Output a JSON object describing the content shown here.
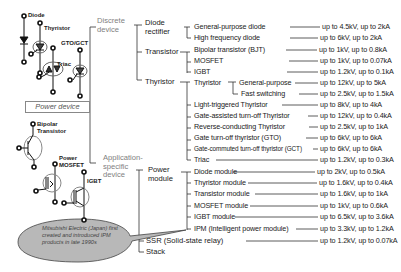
{
  "device_symbols": {
    "diode": "Diode",
    "thyristor": "Thyristor",
    "gto_gct": "GTO/GCT",
    "triac": "Triac",
    "bipolar_transistor": "Bipolar\nTransistor",
    "bipolar_line1": "Bipolar",
    "bipolar_line2": "Transistor",
    "power_mosfet_line1": "Power",
    "power_mosfet_line2": "MOSFET",
    "igbt": "IGBT"
  },
  "root": {
    "label": "Power device"
  },
  "branches": {
    "discrete": {
      "line1": "Discrete",
      "line2": "device"
    },
    "application_specific": {
      "line1": "Application-",
      "line2": "specific",
      "line3": "device"
    }
  },
  "categories": {
    "diode_rectifier": {
      "line1": "Diode",
      "line2": "rectifier"
    },
    "transistor": "Transistor",
    "thyristor": "Thyristor",
    "power_module": {
      "line1": "Power",
      "line2": "module"
    },
    "ssr": "SSR (Solid-state relay)",
    "stack": "Stack"
  },
  "items": [
    {
      "name": "General-purpose diode",
      "rating": "up to 4.5kV, up to 2kA"
    },
    {
      "name": "High frequency diode",
      "rating": "up to 6kV, up to 2kA"
    },
    {
      "name": "Bipolar transistor (BJT)",
      "rating": "up to 1kV, up to 0.8kA"
    },
    {
      "name": "MOSFET",
      "rating": "up to 1kV, up to 0.07kA"
    },
    {
      "name": "IGBT",
      "rating": "up to 1.2kV, up to 0.1kA"
    },
    {
      "name": "Thyristor",
      "sub": "General-purpose",
      "rating": "up to 12kV, up to 5kA"
    },
    {
      "name": "",
      "sub": "Fast switching",
      "rating": "up to 2.5kV, up to 1.5kA"
    },
    {
      "name": "Light-triggered Thyristor",
      "rating": "up to 8kV, up to 4kA"
    },
    {
      "name": "Gate-assisted turn-off Thyristor",
      "rating": "up to 12kV, up to 0.4kA"
    },
    {
      "name": "Reverse-conducting Thyristor",
      "rating": "up to 2.5kV, up to 1kA"
    },
    {
      "name": "Gate turn-off thyristor (GTO)",
      "rating": "up to 6kV, up to 6kA"
    },
    {
      "name": "Gate-commuted turn-off thyristor (GCT)",
      "rating": "up to 6kV, up to 6kA"
    },
    {
      "name": "Triac",
      "rating": "up to 1.2kV, up to 0.3kA"
    },
    {
      "name": "Diode module",
      "rating": "up to 2kV, up to 0.5kA"
    },
    {
      "name": "Thyristor module",
      "rating": "up to 1.6kV, up to 0.4kA"
    },
    {
      "name": "Transistor module",
      "rating": "up to 1.6kV, up to 1kA"
    },
    {
      "name": "MOSFET module",
      "rating": "up to 1kV, up to 0.6kA"
    },
    {
      "name": "IGBT module",
      "rating": "up to 6.5kV, up to 3.6kA"
    },
    {
      "name": "IPM (Intelligent power module)",
      "rating": "up to 3.3kV, up to 1.2kA"
    },
    {
      "name": "SSR (Solid-state relay)",
      "rating": "up to 1.2kV, up to 0.07kA"
    }
  ],
  "callout": {
    "text": "Mitsubishi Electric (Japan) first created  and introduced IPM products in late 1990s",
    "fill": "#b8b8b8"
  },
  "colors": {
    "line": "#333333",
    "grey_text": "#808080"
  }
}
